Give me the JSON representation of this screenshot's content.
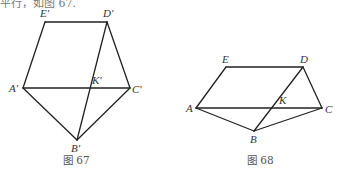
{
  "top_text": "平行，如图 67.",
  "figures": [
    {
      "caption": "图 67",
      "points": {
        "E": {
          "label": "E′",
          "x": 45,
          "y": 22
        },
        "D": {
          "label": "D′",
          "x": 107,
          "y": 22
        },
        "A": {
          "label": "A′",
          "x": 23,
          "y": 88
        },
        "K": {
          "label": "K′",
          "x": 89,
          "y": 88
        },
        "C": {
          "label": "C′",
          "x": 130,
          "y": 88
        },
        "B": {
          "label": "B′",
          "x": 77,
          "y": 140
        }
      },
      "edges": [
        [
          "E",
          "D"
        ],
        [
          "E",
          "A"
        ],
        [
          "D",
          "C"
        ],
        [
          "D",
          "B"
        ],
        [
          "A",
          "C"
        ],
        [
          "A",
          "B"
        ],
        [
          "C",
          "B"
        ]
      ]
    },
    {
      "caption": "图 68",
      "points": {
        "E": {
          "label": "E",
          "x": 226,
          "y": 67
        },
        "D": {
          "label": "D",
          "x": 303,
          "y": 67
        },
        "A": {
          "label": "A",
          "x": 196,
          "y": 108
        },
        "K": {
          "label": "K",
          "x": 275,
          "y": 108
        },
        "C": {
          "label": "C",
          "x": 322,
          "y": 108
        },
        "B": {
          "label": "B",
          "x": 254,
          "y": 131
        }
      },
      "edges": [
        [
          "E",
          "D"
        ],
        [
          "E",
          "A"
        ],
        [
          "D",
          "C"
        ],
        [
          "D",
          "B"
        ],
        [
          "A",
          "C"
        ],
        [
          "A",
          "B"
        ],
        [
          "C",
          "B"
        ]
      ]
    }
  ]
}
